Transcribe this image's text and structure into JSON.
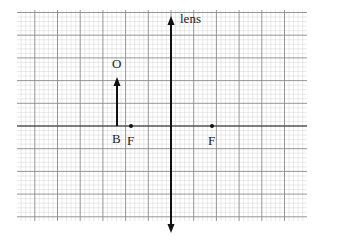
{
  "diagram": {
    "grid": {
      "left": 17,
      "top": 10,
      "right": 307,
      "bottom": 221,
      "major_spacing": 22.7,
      "minor_per_major": 5,
      "major_color": "#8a8a8a",
      "minor_color": "#d4d4d4"
    },
    "optical_axis": {
      "y": 126,
      "color": "#333333"
    },
    "lens": {
      "x": 171,
      "top": 16,
      "bottom": 233,
      "label": "lens"
    },
    "object": {
      "x": 117,
      "base_y": 126,
      "top_y": 77,
      "label": "O",
      "base_label": "B"
    },
    "focal_points": [
      {
        "x": 131,
        "label": "F"
      },
      {
        "x": 212,
        "label": "F"
      }
    ]
  }
}
